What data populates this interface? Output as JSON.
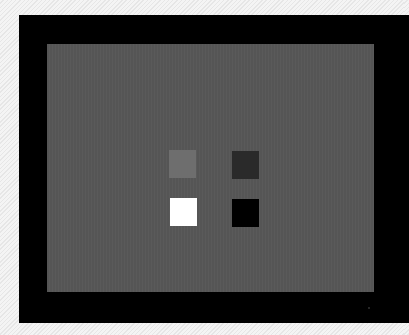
{
  "scene": {
    "description": "Photo of a monitor displaying a gray test pattern with four luminance patches",
    "background_color": "#eeeeee",
    "bezel_color": "#000000",
    "screen_color": "#575757"
  },
  "patches": [
    {
      "name": "light-gray-patch",
      "color": "#6e6e6e",
      "left": 122,
      "top": 106
    },
    {
      "name": "dark-gray-patch",
      "color": "#2a2a2a",
      "left": 185,
      "top": 107
    },
    {
      "name": "white-patch",
      "color": "#ffffff",
      "left": 123,
      "top": 154
    },
    {
      "name": "black-patch",
      "color": "#000000",
      "left": 185,
      "top": 155
    }
  ]
}
